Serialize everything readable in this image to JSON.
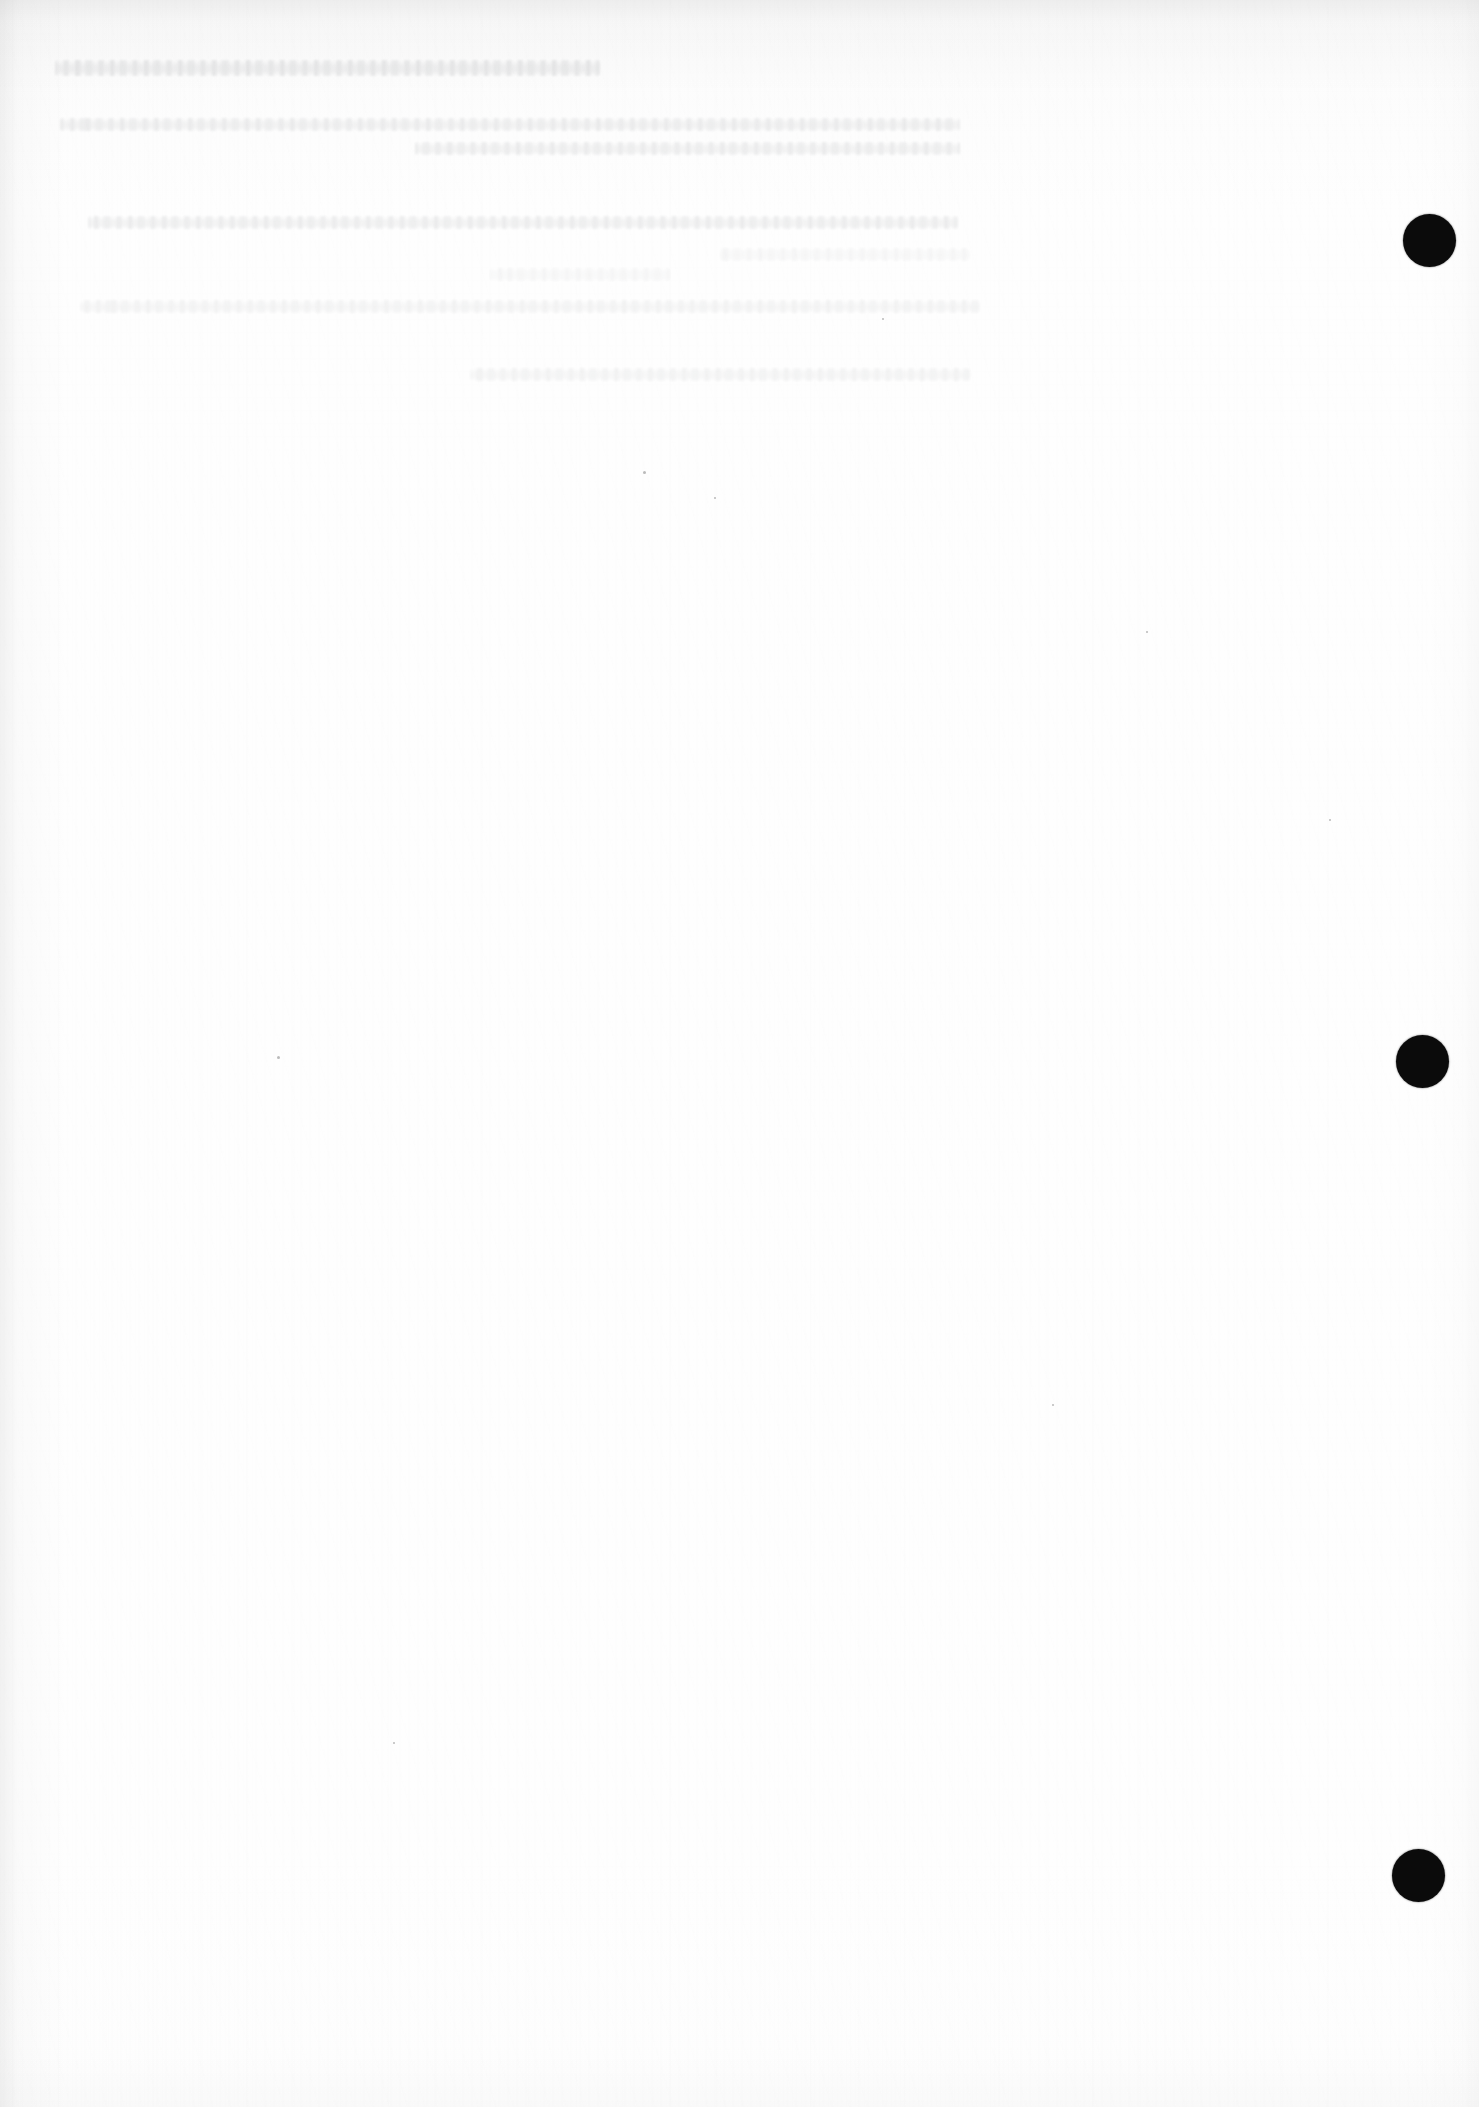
{
  "document": {
    "kind": "scanned-page",
    "page_width": 1479,
    "page_height": 2107,
    "paper_color": "#fdfdfd",
    "ink_color": "#0b0b0b",
    "condition_note": "blank scanned sheet with faint show-through",
    "legible_text": ""
  },
  "ghost_text": {
    "note": "Bleed-through from reverse side; no characters are legible.",
    "heading": {
      "content": "",
      "left": 55,
      "top": 60,
      "width": 545
    },
    "paragraphs": [
      {
        "lines": [
          {
            "content": "",
            "left": 60,
            "top": 118,
            "width": 900
          },
          {
            "content": "",
            "left": 415,
            "top": 142,
            "width": 545
          }
        ]
      },
      {
        "lines": [
          {
            "content": "",
            "left": 88,
            "top": 216,
            "width": 870
          },
          {
            "content": "",
            "left": 720,
            "top": 248,
            "width": 250
          },
          {
            "content": "",
            "left": 490,
            "top": 268,
            "width": 180
          }
        ]
      },
      {
        "lines": [
          {
            "content": "",
            "left": 80,
            "top": 300,
            "width": 900
          },
          {
            "content": "",
            "left": 470,
            "top": 368,
            "width": 500
          }
        ]
      }
    ]
  },
  "marks": {
    "label": "registration punch marks",
    "items": [
      {
        "name": "punch-mark-top",
        "cx": 1429,
        "cy": 240,
        "d": 53
      },
      {
        "name": "punch-mark-middle",
        "cx": 1422,
        "cy": 1061,
        "d": 53
      },
      {
        "name": "punch-mark-bottom",
        "cx": 1418,
        "cy": 1875,
        "d": 53
      }
    ]
  },
  "specks": [
    {
      "x": 643,
      "y": 471,
      "s": 3
    },
    {
      "x": 714,
      "y": 497,
      "s": 2
    },
    {
      "x": 277,
      "y": 1056,
      "s": 3
    },
    {
      "x": 1146,
      "y": 631,
      "s": 2
    },
    {
      "x": 1329,
      "y": 819,
      "s": 2
    },
    {
      "x": 882,
      "y": 318,
      "s": 2
    },
    {
      "x": 1052,
      "y": 1404,
      "s": 2
    },
    {
      "x": 393,
      "y": 1742,
      "s": 2
    }
  ]
}
